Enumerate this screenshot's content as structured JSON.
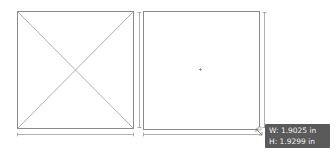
{
  "canvas": {
    "background": "#ffffff",
    "stroke_color": "#8a8a8a",
    "shapes": [
      {
        "name": "placeholder-frame",
        "x": 17,
        "y": 11,
        "width": 116,
        "height": 117,
        "has_cross": true
      },
      {
        "name": "selected-frame",
        "x": 143,
        "y": 11,
        "width": 116,
        "height": 118,
        "has_center_mark": true
      }
    ]
  },
  "tooltip": {
    "width_label": "W: 1.9025 in",
    "height_label": "H: 1.9299 in",
    "background": "#5a5a5a"
  }
}
